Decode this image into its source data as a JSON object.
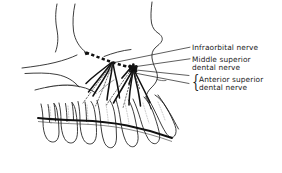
{
  "figure": {
    "background_color": "#ffffff",
    "ink_color": "#1a1a1a",
    "width": 282,
    "height": 173
  },
  "labels": {
    "infraorbital_nerve": "Infraorbital nerve",
    "middle_superior_line1": "Middle superior",
    "middle_superior_line2": "dental nerve",
    "anterior_superior_line1": "Anterior superior",
    "anterior_superior_line2": "dental nerve",
    "brace": "{"
  },
  "structures": [
    {
      "name": "infraorbital-nerve-dashed",
      "style": "dashed-thick",
      "description": "Dashed nerve trunk along infraorbital rim"
    },
    {
      "name": "nerve-plexus-blob",
      "style": "filled-ink",
      "description": "Dark ink blob marking nerve plexus node"
    },
    {
      "name": "middle-superior-dental-branches",
      "style": "solid-thick",
      "description": "Branches descending to premolar roots"
    },
    {
      "name": "anterior-superior-dental-branches",
      "style": "solid-thick",
      "description": "Branches descending to incisor and canine roots"
    },
    {
      "name": "posterior-branches-dotted",
      "style": "dotted-thin",
      "description": "Fine dotted intraosseous branches"
    },
    {
      "name": "skull-profile-outline",
      "style": "solid-thin",
      "description": "Facial and skull contour lines"
    },
    {
      "name": "maxillary-teeth",
      "style": "solid-thin",
      "description": "Upper dentition with roots, molars to incisors"
    },
    {
      "name": "alveolar-gum-line",
      "style": "solid-thick",
      "description": "Curved alveolar bone margin crossing the teeth"
    }
  ]
}
